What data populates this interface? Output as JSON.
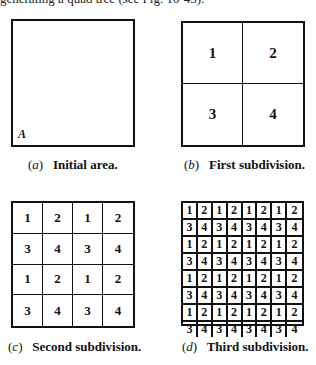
{
  "header": {
    "text": "generating a quad tree (see Fig. 10-43)."
  },
  "panels": [
    {
      "id": "a",
      "corner_label": "A",
      "caption_letter": "a",
      "caption_text": "Initial area.",
      "grid_size": 1,
      "cells": []
    },
    {
      "id": "b",
      "caption_letter": "b",
      "caption_text": "First subdivision.",
      "grid_size": 2,
      "cells": [
        "1",
        "2",
        "3",
        "4"
      ]
    },
    {
      "id": "c",
      "caption_letter": "c",
      "caption_text": "Second subdivision.",
      "grid_size": 4,
      "cells": [
        "1",
        "2",
        "1",
        "2",
        "3",
        "4",
        "3",
        "4",
        "1",
        "2",
        "1",
        "2",
        "3",
        "4",
        "3",
        "4"
      ]
    },
    {
      "id": "d",
      "caption_letter": "d",
      "caption_text": "Third subdivision.",
      "grid_size": 8,
      "cells": [
        "1",
        "2",
        "1",
        "2",
        "1",
        "2",
        "1",
        "2",
        "3",
        "4",
        "3",
        "4",
        "3",
        "4",
        "3",
        "4",
        "1",
        "2",
        "1",
        "2",
        "1",
        "2",
        "1",
        "2",
        "3",
        "4",
        "3",
        "4",
        "3",
        "4",
        "3",
        "4",
        "1",
        "2",
        "1",
        "2",
        "1",
        "2",
        "1",
        "2",
        "3",
        "4",
        "3",
        "4",
        "3",
        "4",
        "3",
        "4",
        "1",
        "2",
        "1",
        "2",
        "1",
        "2",
        "1",
        "2",
        "3",
        "4",
        "3",
        "4",
        "3",
        "4",
        "3",
        "4"
      ]
    }
  ],
  "colors": {
    "line": "#111111",
    "background": "#ffffff"
  }
}
